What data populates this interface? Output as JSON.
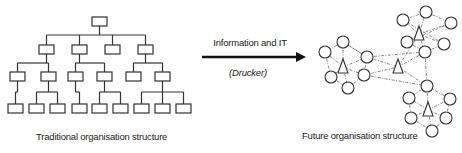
{
  "labels": {
    "left_caption": "Traditional organisation structure",
    "right_caption": "Future organisation structure",
    "arrow_top": "Information and IT",
    "arrow_bottom": "(Drucker)"
  },
  "colors": {
    "stroke": "#333333",
    "text": "#222222",
    "background": "#ffffff"
  },
  "tree": {
    "node_w": 15,
    "node_h": 9,
    "nodes": [
      {
        "id": "root",
        "x": 92,
        "y": 17,
        "parent": null
      },
      {
        "id": "a",
        "x": 39,
        "y": 45,
        "parent": "root"
      },
      {
        "id": "b",
        "x": 72,
        "y": 45,
        "parent": "root"
      },
      {
        "id": "c",
        "x": 105,
        "y": 45,
        "parent": "root"
      },
      {
        "id": "d",
        "x": 138,
        "y": 45,
        "parent": "root"
      },
      {
        "id": "a1",
        "x": 10,
        "y": 72,
        "parent": "a"
      },
      {
        "id": "a2",
        "x": 41,
        "y": 72,
        "parent": "a"
      },
      {
        "id": "b1",
        "x": 68,
        "y": 72,
        "parent": "b"
      },
      {
        "id": "b2",
        "x": 97,
        "y": 72,
        "parent": "b"
      },
      {
        "id": "d1",
        "x": 126,
        "y": 72,
        "parent": "d"
      },
      {
        "id": "d2",
        "x": 155,
        "y": 72,
        "parent": "d"
      },
      {
        "id": "a1x",
        "x": 8,
        "y": 104,
        "parent": "a1"
      },
      {
        "id": "a2x",
        "x": 29,
        "y": 104,
        "parent": "a2"
      },
      {
        "id": "a2y",
        "x": 50,
        "y": 104,
        "parent": "a2"
      },
      {
        "id": "b1x",
        "x": 72,
        "y": 104,
        "parent": "b1"
      },
      {
        "id": "b2x",
        "x": 92,
        "y": 104,
        "parent": "b2"
      },
      {
        "id": "b2y",
        "x": 113,
        "y": 104,
        "parent": "b2"
      },
      {
        "id": "d2x",
        "x": 134,
        "y": 104,
        "parent": "d2"
      },
      {
        "id": "d2y",
        "x": 155,
        "y": 104,
        "parent": "d2"
      },
      {
        "id": "d2z",
        "x": 176,
        "y": 104,
        "parent": "d2"
      }
    ]
  },
  "arrow": {
    "x1": 202,
    "y": 57,
    "x2": 306
  },
  "network": {
    "circle_r": 6,
    "clusters": [
      {
        "name": "left",
        "triangle": {
          "x": 343,
          "y": 67
        },
        "circles": [
          [
            343,
            42
          ],
          [
            325,
            52
          ],
          [
            367,
            57
          ],
          [
            331,
            77
          ],
          [
            364,
            75
          ],
          [
            348,
            88
          ]
        ]
      },
      {
        "name": "top-right",
        "triangle": {
          "x": 419,
          "y": 34
        },
        "circles": [
          [
            426,
            12
          ],
          [
            451,
            23
          ],
          [
            403,
            20
          ],
          [
            407,
            42
          ],
          [
            444,
            44
          ],
          [
            425,
            52
          ]
        ]
      },
      {
        "name": "bottom-right",
        "triangle": {
          "x": 428,
          "y": 110
        },
        "circles": [
          [
            427,
            86
          ],
          [
            409,
            98
          ],
          [
            450,
            99
          ],
          [
            411,
            118
          ],
          [
            446,
            118
          ],
          [
            432,
            131
          ]
        ]
      }
    ],
    "center_triangle": {
      "x": 398,
      "y": 67
    },
    "links": [
      [
        367,
        57,
        398,
        67
      ],
      [
        364,
        75,
        398,
        67
      ],
      [
        398,
        67,
        425,
        52
      ],
      [
        398,
        67,
        427,
        86
      ],
      [
        367,
        57,
        425,
        52
      ],
      [
        364,
        75,
        427,
        86
      ],
      [
        425,
        52,
        427,
        86
      ],
      [
        343,
        42,
        367,
        57
      ],
      [
        419,
        34,
        398,
        67
      ]
    ]
  }
}
